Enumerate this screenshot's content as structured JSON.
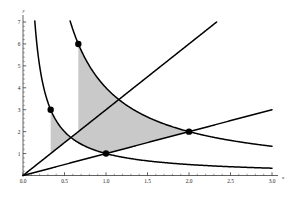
{
  "chart_data": {
    "type": "line",
    "title": "",
    "subtitle": "",
    "xlabel": "x",
    "ylabel": "y",
    "xlim": [
      0.0,
      3.0
    ],
    "ylim": [
      0.0,
      7.0
    ],
    "grid": false,
    "legend": null,
    "shaded_region": {
      "label": "",
      "fill_color": "#c9c9c9",
      "edge_color": "#000000",
      "description": "Curvilinear quadrilateral bounded by xy=1, xy=4, y=x, y=3x",
      "corners": [
        {
          "x": 0.3333,
          "y": 3.0
        },
        {
          "x": 0.6667,
          "y": 6.0
        },
        {
          "x": 2.0,
          "y": 2.0
        },
        {
          "x": 1.0,
          "y": 1.0
        }
      ]
    },
    "series": [
      {
        "name": "xy = 1",
        "type": "hyperbola",
        "color": "#000000",
        "points": [
          {
            "x": 0.1429,
            "y": 7.0
          },
          {
            "x": 0.3333,
            "y": 3.0
          },
          {
            "x": 0.5,
            "y": 2.0
          },
          {
            "x": 1.0,
            "y": 1.0
          },
          {
            "x": 2.0,
            "y": 0.5
          },
          {
            "x": 3.0,
            "y": 0.3333
          }
        ]
      },
      {
        "name": "xy = 4",
        "type": "hyperbola",
        "color": "#000000",
        "points": [
          {
            "x": 0.5714,
            "y": 7.0
          },
          {
            "x": 0.6667,
            "y": 6.0
          },
          {
            "x": 1.0,
            "y": 4.0
          },
          {
            "x": 2.0,
            "y": 2.0
          },
          {
            "x": 3.0,
            "y": 1.3333
          }
        ]
      },
      {
        "name": "y = x",
        "type": "line",
        "color": "#000000",
        "points": [
          {
            "x": 0.0,
            "y": 0.0
          },
          {
            "x": 1.0,
            "y": 1.0
          },
          {
            "x": 2.0,
            "y": 2.0
          },
          {
            "x": 3.0,
            "y": 3.0
          }
        ]
      },
      {
        "name": "y = 3x",
        "type": "line",
        "color": "#000000",
        "points": [
          {
            "x": 0.0,
            "y": 0.0
          },
          {
            "x": 0.3333,
            "y": 1.0
          },
          {
            "x": 0.6667,
            "y": 2.0
          },
          {
            "x": 2.3333,
            "y": 7.0
          }
        ]
      }
    ],
    "markers": [
      {
        "x": 0.3333,
        "y": 3.0,
        "label": ""
      },
      {
        "x": 0.6667,
        "y": 6.0,
        "label": ""
      },
      {
        "x": 1.0,
        "y": 1.0,
        "label": ""
      },
      {
        "x": 2.0,
        "y": 2.0,
        "label": ""
      }
    ],
    "xticks": [
      {
        "value": 0.0,
        "label": "0.0"
      },
      {
        "value": 0.5,
        "label": "0.5"
      },
      {
        "value": 1.0,
        "label": "1.0"
      },
      {
        "value": 1.5,
        "label": "1.5"
      },
      {
        "value": 2.0,
        "label": "2.0"
      },
      {
        "value": 2.5,
        "label": "2.5"
      },
      {
        "value": 3.0,
        "label": "3.0"
      }
    ],
    "yticks": [
      {
        "value": 1,
        "label": "1"
      },
      {
        "value": 2,
        "label": "2"
      },
      {
        "value": 3,
        "label": "3"
      },
      {
        "value": 4,
        "label": "4"
      },
      {
        "value": 5,
        "label": "5"
      },
      {
        "value": 6,
        "label": "6"
      },
      {
        "value": 7,
        "label": "7"
      }
    ],
    "x_minor_step": 0.1,
    "y_minor_step": 0.2,
    "colors": {
      "background": "#ffffff",
      "axis": "#3a3a3a",
      "curve": "#000000",
      "marker": "#000000",
      "shade": "#c9c9c9"
    }
  }
}
